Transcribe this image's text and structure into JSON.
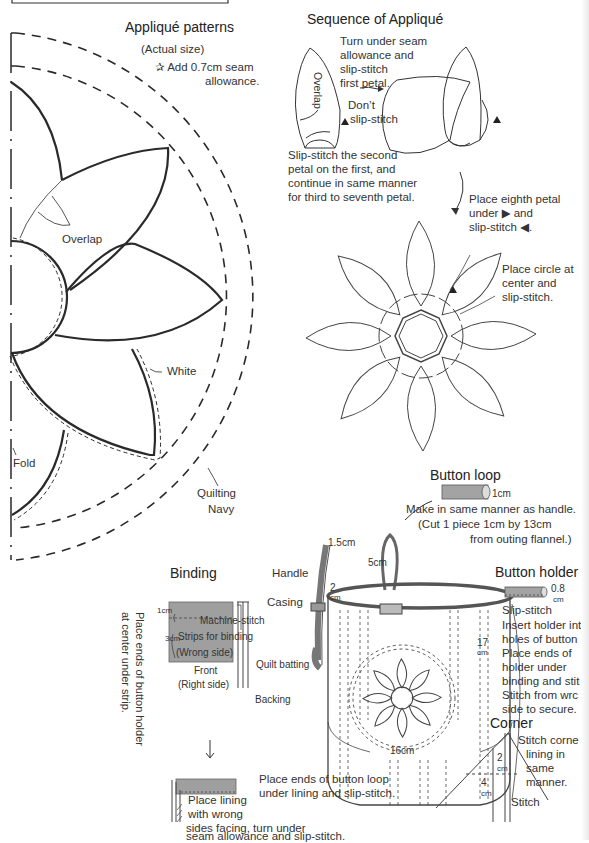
{
  "pattern": {
    "title": "Appliqué patterns",
    "subtitle": "(Actual size)",
    "note_line1": "Add 0.7cm seam",
    "note_line2": "allowance.",
    "note_icon": "star-icon",
    "labels": {
      "overlap": "Overlap",
      "white": "White",
      "fold": "Fold",
      "quilting": "Quilting",
      "navy": "Navy"
    }
  },
  "sequence": {
    "title": "Sequence of Appliqué",
    "step1": [
      "Turn under seam",
      "allowance and",
      "slip-stitch",
      "first petal."
    ],
    "overlap_label": "Overlap",
    "dont_label": [
      "Don’t",
      "slip-stitch"
    ],
    "step2": [
      "Slip-stitch the second",
      "petal on the first, and",
      "continue in same manner",
      "for third to seventh petal."
    ],
    "step3": [
      "Place eighth petal",
      "under",
      "and",
      "slip-stitch",
      "."
    ],
    "step4": [
      "Place circle at",
      "center and",
      "slip-stitch."
    ]
  },
  "button_loop": {
    "title": "Button loop",
    "dim": "1cm",
    "text": [
      "Make in same manner as handle.",
      "(Cut 1 piece 1cm by 13cm",
      "from outing flannel.)"
    ]
  },
  "bag": {
    "labels": {
      "handle": "Handle",
      "handle_width": "1.5cm",
      "casing": "Casing",
      "casing_dim": "2",
      "loop_dim": "5cm",
      "height": "17",
      "width": "16cm",
      "unit": "cm"
    }
  },
  "button_holder": {
    "title": "Button holder",
    "dim": "0.8",
    "unit": "cm",
    "slip": "Slip-stitch",
    "text": [
      "Insert holder int",
      "holes of button",
      "Place ends of",
      "holder under",
      "binding and stit",
      "Stitch from wrc",
      "side to secure."
    ]
  },
  "binding": {
    "title": "Binding",
    "dim_1": "1cm",
    "dim_3": "3cm",
    "machine": "Machine-stitch",
    "strips": "Strips for binding",
    "wrong": "(Wrong side)",
    "front": "Front",
    "right": "(Right side)",
    "batting": "Quilt batting",
    "backing": "Backing",
    "vertical_note": [
      "Place ends of button holder",
      "at center under strip."
    ],
    "lining_note": [
      "Place lining",
      "with wrong",
      "sides facing, turn under",
      "seam allowance and slip-stitch."
    ],
    "loop_note": [
      "Place ends of button loop",
      "under lining and slip-stitch."
    ]
  },
  "corner": {
    "title": "Corner",
    "dim_2": "2",
    "dim_4": "4",
    "unit": "cm",
    "stitch": "Stitch",
    "text": [
      "Stitch corne",
      "lining in",
      "same",
      "manner."
    ]
  },
  "colors": {
    "line": "#2a2a2a",
    "fabric_gray": "#9a9a9a",
    "paper": "#ffffff"
  }
}
